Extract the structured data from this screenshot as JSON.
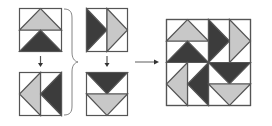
{
  "diagram": {
    "colors": {
      "background": "#ffffff",
      "outline": "#555555",
      "light": "#c8c8c8",
      "dark": "#3c3c3c"
    },
    "units": [
      {
        "id": "unit-up",
        "label": "Geese pointing up",
        "halves": [
          {
            "triangle": "light",
            "direction": "up"
          },
          {
            "triangle": "dark",
            "direction": "up"
          }
        ]
      },
      {
        "id": "unit-left",
        "label": "Geese pointing left",
        "halves": [
          {
            "triangle": "light",
            "direction": "left"
          },
          {
            "triangle": "dark",
            "direction": "left"
          }
        ]
      },
      {
        "id": "unit-right",
        "label": "Geese pointing right",
        "halves": [
          {
            "triangle": "dark",
            "direction": "right"
          },
          {
            "triangle": "light",
            "direction": "right"
          }
        ]
      },
      {
        "id": "unit-down",
        "label": "Geese pointing down",
        "halves": [
          {
            "triangle": "dark",
            "direction": "down"
          },
          {
            "triangle": "light",
            "direction": "down"
          }
        ]
      }
    ],
    "result_label": "Assembled 4-unit block"
  }
}
